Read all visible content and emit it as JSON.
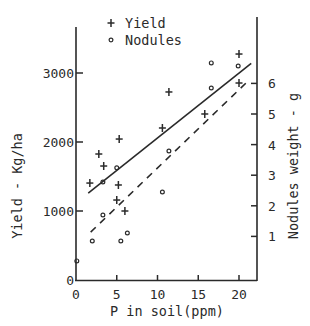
{
  "chart_data": {
    "type": "scatter",
    "title": "",
    "xlabel": "P in soil(ppm)",
    "ylabel_left": "Yield - Kg/ha",
    "ylabel_right": "Nodules weight - g",
    "x_ticks": [
      "0",
      "5",
      "10",
      "15",
      "20"
    ],
    "y_left_ticks": [
      "0",
      "1000",
      "2000",
      "3000"
    ],
    "y_right_ticks": [
      "1",
      "2",
      "3",
      "4",
      "5",
      "6"
    ],
    "xlim": [
      0,
      22
    ],
    "ylim_left": [
      0,
      3650
    ],
    "ylim_right": [
      0,
      8
    ],
    "grid": false,
    "legend": {
      "position": "top-center",
      "entries": [
        {
          "marker": "+",
          "label": "Yield"
        },
        {
          "marker": "o",
          "label": "Nodules"
        }
      ]
    },
    "series": [
      {
        "name": "Yield",
        "axis": "left",
        "marker": "+",
        "points": [
          [
            1.7,
            1405
          ],
          [
            2.8,
            1826
          ],
          [
            3.4,
            1652
          ],
          [
            5.3,
            2043
          ],
          [
            5.0,
            1159
          ],
          [
            5.2,
            1377
          ],
          [
            6.0,
            1000
          ],
          [
            10.6,
            2203
          ],
          [
            11.4,
            2725
          ],
          [
            15.8,
            2406
          ],
          [
            20.0,
            3275
          ],
          [
            20.0,
            2855
          ]
        ],
        "trend": {
          "style": "solid",
          "from": [
            1.5,
            1260
          ],
          "to": [
            21.5,
            3140
          ]
        }
      },
      {
        "name": "Nodules",
        "axis": "right",
        "marker": "o",
        "points": [
          [
            2.0,
            0.85
          ],
          [
            3.3,
            1.7
          ],
          [
            3.3,
            2.78
          ],
          [
            5.0,
            3.24
          ],
          [
            5.5,
            0.85
          ],
          [
            6.3,
            1.11
          ],
          [
            10.6,
            2.45
          ],
          [
            11.4,
            3.79
          ],
          [
            16.6,
            5.85
          ],
          [
            16.6,
            6.67
          ],
          [
            19.9,
            6.57
          ],
          [
            0.1,
            0.2
          ]
        ],
        "trend": {
          "style": "dashed",
          "from": [
            1.8,
            1.14
          ],
          "to": [
            21.0,
            6.05
          ]
        }
      }
    ]
  }
}
